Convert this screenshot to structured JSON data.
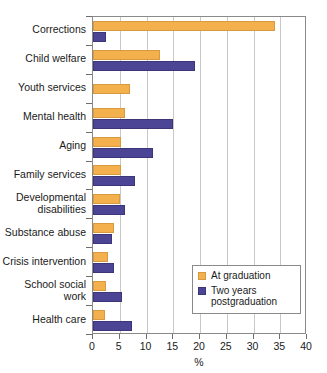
{
  "chart_data": {
    "type": "bar",
    "orientation": "horizontal",
    "title": "",
    "xlabel": "%",
    "ylabel": "",
    "xlim": [
      0,
      40
    ],
    "xticks": [
      0,
      5,
      10,
      15,
      20,
      25,
      30,
      35,
      40
    ],
    "grid": true,
    "legend_position": "lower-right",
    "categories": [
      "Corrections",
      "Child welfare",
      "Youth services",
      "Mental health",
      "Aging",
      "Family services",
      "Developmental disabilities",
      "Substance abuse",
      "Crisis intervention",
      "School social work",
      "Health care"
    ],
    "series": [
      {
        "name": "At graduation",
        "color": "#f3b04c",
        "values": [
          34.0,
          12.5,
          7.0,
          6.0,
          5.2,
          5.2,
          5.0,
          4.0,
          2.8,
          2.5,
          2.3
        ]
      },
      {
        "name": "Two years postgraduation",
        "color": "#4c4596",
        "values": [
          2.5,
          19.0,
          0,
          15.0,
          11.2,
          7.8,
          6.0,
          3.5,
          4.0,
          5.5,
          7.2
        ]
      }
    ]
  },
  "axis": {
    "x_title": "%",
    "tick_labels": [
      "0",
      "5",
      "10",
      "15",
      "20",
      "25",
      "30",
      "35",
      "40"
    ]
  },
  "legend": {
    "entries": [
      {
        "label": "At graduation",
        "color": "#f3b04c"
      },
      {
        "label": "Two years postgraduation",
        "color": "#4c4596"
      }
    ]
  },
  "colors": {
    "series_at_graduation": "#f3b04c",
    "series_two_years": "#4c4596",
    "frame": "#8a8a8a",
    "gridline": "#c9c9c9",
    "background": "#ffffff",
    "text": "#1a1a1a"
  }
}
